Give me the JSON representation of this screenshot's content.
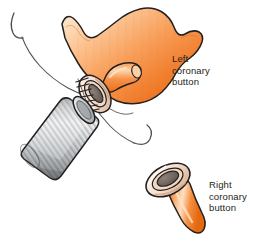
{
  "figure": {
    "background_color": "#ffffff",
    "width": 256,
    "height": 245
  },
  "labels": {
    "left_button": "Left\ncoronary\nbutton",
    "right_button": "Right\ncoronary\nbutton",
    "text_color": "#231f20"
  },
  "palette": {
    "aorta_orange_dark": "#ee7824",
    "aorta_orange_mid": "#f79450",
    "aorta_orange_light": "#fbc893",
    "aorta_highlight": "#fde2c4",
    "button_rim_cream": "#f6e3d2",
    "button_rim_shade": "#d9b79b",
    "lumen_grey": "#6f625c",
    "graft_grey_light": "#e9eaeb",
    "graft_grey_mid": "#b9bcbe",
    "graft_grey_dark": "#8c9093",
    "outline": "#231f20",
    "suture_thread": "#4a4a4a"
  },
  "elements": {
    "aortic_root": "aortic-root-body",
    "left_coronary_button": "left-coronary-button-ring",
    "left_coronary_stub": "left-coronary-artery-stub",
    "graft_tube": "corrugated-dacron-graft",
    "suture_line": "running-suture-stitches",
    "needle_upper": "curved-suture-needle-upper",
    "needle_lower": "curved-suture-needle-lower",
    "right_coronary_button": "right-coronary-button-ring",
    "right_coronary_stem": "right-coronary-artery-stem"
  }
}
